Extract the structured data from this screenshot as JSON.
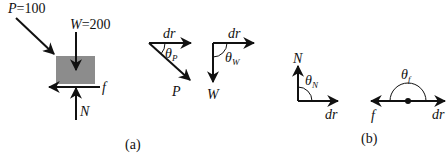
{
  "panel_a": {
    "caption": "(a)",
    "block": {
      "color": "#8c8c8c"
    },
    "forces": {
      "P_label": "P",
      "P_eq": "=100",
      "W_label": "W",
      "W_eq": "=200",
      "f_label": "f",
      "N_label": "N"
    },
    "vector_diagrams": [
      {
        "name": "P",
        "displacement_label": "dr",
        "force_label": "P",
        "angle_label": "θ",
        "angle_sub": "P"
      },
      {
        "name": "W",
        "displacement_label": "dr",
        "force_label": "W",
        "angle_label": "θ",
        "angle_sub": "W"
      }
    ]
  },
  "panel_b": {
    "caption": "(b)",
    "vector_diagrams": [
      {
        "name": "N",
        "displacement_label": "dr",
        "force_label": "N",
        "angle_label": "θ",
        "angle_sub": "N"
      },
      {
        "name": "f",
        "displacement_label": "dr",
        "force_label": "f",
        "angle_label": "θ",
        "angle_sub": "f"
      }
    ]
  }
}
